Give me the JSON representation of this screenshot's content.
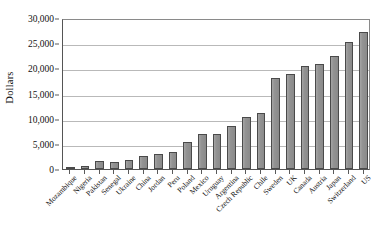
{
  "chart_data": {
    "type": "bar",
    "title": "",
    "xlabel": "",
    "ylabel": "Dollars",
    "ylim": [
      0,
      30000
    ],
    "grid": true,
    "legend": null,
    "y_tick_labels": [
      "30,000",
      "25,000",
      "20,000",
      "15,000",
      "10,000",
      "5,000",
      "0"
    ],
    "y_ticks": [
      30000,
      25000,
      20000,
      15000,
      10000,
      5000,
      0
    ],
    "categories": [
      "Mozambique",
      "Nigeria",
      "Pakistan",
      "Senegal",
      "Ukraine",
      "China",
      "Jordan",
      "Peru",
      "Poland",
      "Mexico",
      "Uruguay",
      "Argentina",
      "Czech Republic",
      "Chile",
      "Sweden",
      "UK",
      "Canada",
      "Austria",
      "Japan",
      "Switzerland",
      "US"
    ],
    "values": [
      300,
      600,
      1500,
      1300,
      1800,
      2600,
      2900,
      3400,
      5300,
      7000,
      7000,
      8500,
      10300,
      11200,
      18000,
      18800,
      20500,
      20800,
      22400,
      25300,
      27200
    ],
    "bar_color": "#8f8f8f",
    "bar_edge_color": "#4a4a4a",
    "gridline_color": "#b9b9b9",
    "axis_color": "#555555",
    "background_color": "#ffffff"
  }
}
